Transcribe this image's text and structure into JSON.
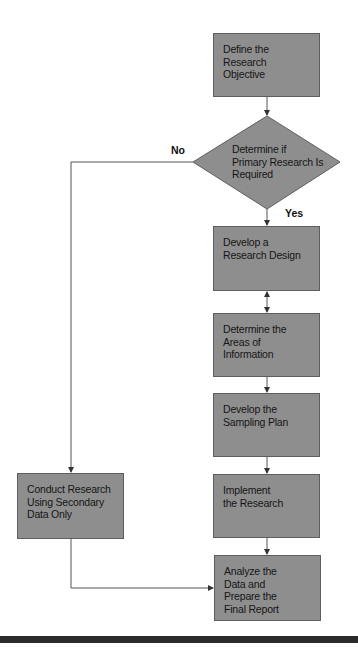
{
  "flowchart": {
    "colors": {
      "box_fill": "#8e8e8e",
      "box_border": "#5e5e5e",
      "text": "#161616",
      "line": "#555555",
      "rule": "#2b2b2b"
    },
    "nodes": {
      "define_objective": {
        "label": "Define the\nResearch\nObjective",
        "shape": "rectangle"
      },
      "primary_decision": {
        "label": "Determine if\nPrimary Research Is\nRequired",
        "shape": "diamond"
      },
      "research_design": {
        "label": "Develop a\nResearch Design",
        "shape": "rectangle"
      },
      "areas_information": {
        "label": "Determine the\nAreas of\nInformation",
        "shape": "rectangle"
      },
      "sampling_plan": {
        "label": "Develop the\nSampling Plan",
        "shape": "rectangle"
      },
      "implement": {
        "label": "Implement\nthe Research",
        "shape": "rectangle"
      },
      "analyze_report": {
        "label": "Analyze the\nData and\nPrepare the\nFinal Report",
        "shape": "rectangle"
      },
      "secondary_data": {
        "label": "Conduct Research\nUsing Secondary\nData Only",
        "shape": "rectangle"
      }
    },
    "edge_labels": {
      "no": "No",
      "yes": "Yes"
    },
    "edges": [
      {
        "from": "define_objective",
        "to": "primary_decision"
      },
      {
        "from": "primary_decision",
        "to": "research_design",
        "label": "Yes"
      },
      {
        "from": "primary_decision",
        "to": "secondary_data",
        "label": "No"
      },
      {
        "from": "research_design",
        "to": "areas_information",
        "bidirectional": true
      },
      {
        "from": "areas_information",
        "to": "sampling_plan"
      },
      {
        "from": "sampling_plan",
        "to": "implement"
      },
      {
        "from": "implement",
        "to": "analyze_report"
      },
      {
        "from": "secondary_data",
        "to": "analyze_report"
      }
    ]
  }
}
